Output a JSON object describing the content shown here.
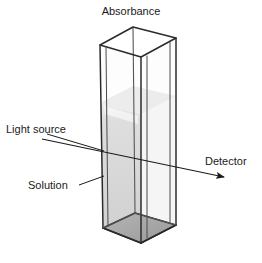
{
  "figure": {
    "kind": "spectrophotometer-cuvette-diagram",
    "background_color": "#ffffff"
  },
  "labels": {
    "title": "Absorbance",
    "light_source": "Light source",
    "solution": "Solution",
    "detector": "Detector"
  },
  "colors": {
    "outline": "#2b2b2b",
    "inner_edge": "#555555",
    "solution_fill": "#d3d3d3",
    "base_fill": "#a8a8a8",
    "beam": "#1a1a1a",
    "text": "#1a1a1a",
    "glass": "#fbfbfb"
  },
  "geometry": {
    "cuvette_top_face": "100,45 133,27 176,38 141,57",
    "cuvette_bottom_face": "103,228 135,213 176,225 141,243",
    "solution_level_y": 103,
    "beam_start": "42,139",
    "beam_end": "228,178"
  }
}
